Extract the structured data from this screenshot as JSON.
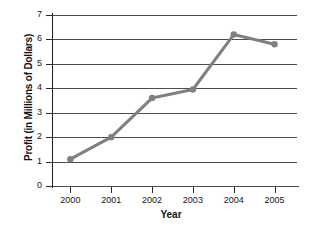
{
  "chart_data": {
    "type": "line",
    "title": "",
    "xlabel": "Year",
    "ylabel": "Profit (in Millions of Dollars)",
    "categories": [
      "2000",
      "2001",
      "2002",
      "2003",
      "2004",
      "2005"
    ],
    "values": [
      1.1,
      2.0,
      3.6,
      3.95,
      6.2,
      5.8
    ],
    "ylim": [
      0,
      7
    ],
    "yticks": [
      "0",
      "1",
      "2",
      "3",
      "4",
      "5",
      "6",
      "7"
    ],
    "grid": true,
    "legend": "none",
    "series_color": "#808080",
    "marker": "circle",
    "marker_color": "#808080",
    "axis_color": "#4d4d4d",
    "text_color": "#151515"
  }
}
